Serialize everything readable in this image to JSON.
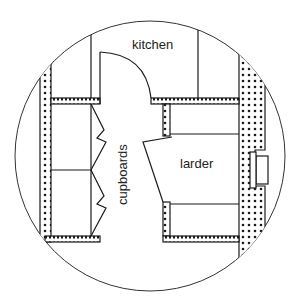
{
  "diagram": {
    "type": "floor-plan",
    "labels": {
      "kitchen": "kitchen",
      "cupboards": "cupboards",
      "larder": "larder"
    },
    "colors": {
      "line": "#1a1a1a",
      "background": "#ffffff",
      "wall_fill": "#ffffff",
      "dot": "#1a1a1a"
    },
    "elements": [
      "circular-frame",
      "outer-wall-left",
      "outer-wall-right",
      "kitchen-door-swing",
      "cupboard-doors",
      "larder-door",
      "larder-shelves",
      "window"
    ]
  }
}
